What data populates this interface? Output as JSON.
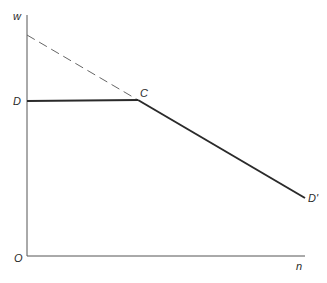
{
  "diagram": {
    "type": "economic-line-diagram",
    "axes": {
      "y_label": "w",
      "x_label": "n",
      "origin_label": "O"
    },
    "points": {
      "D": {
        "label": "D"
      },
      "C": {
        "label": "C"
      },
      "D_prime": {
        "label": "D'"
      }
    },
    "lines": [
      {
        "name": "horizontal-segment",
        "from": "D",
        "to": "C",
        "style": "solid"
      },
      {
        "name": "downward-segment",
        "from": "C",
        "to": "D'",
        "style": "solid"
      },
      {
        "name": "dashed-extension",
        "from": "w-axis",
        "to": "C",
        "style": "dashed"
      }
    ],
    "colors": {
      "line": "#2a2a2a",
      "axis": "#555555",
      "dashed": "#666666"
    }
  }
}
